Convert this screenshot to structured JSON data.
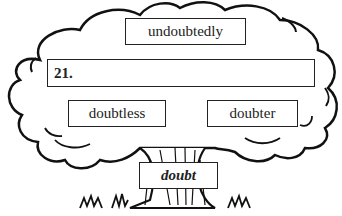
{
  "diagram": {
    "type": "word-family tree",
    "root_word": "doubt",
    "branches": {
      "top": "undoubtedly",
      "answer_line_label": "21.",
      "left": "doubtless",
      "right": "doubter"
    }
  }
}
